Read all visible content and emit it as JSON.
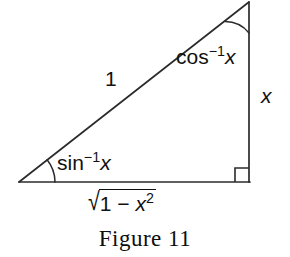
{
  "figure": {
    "caption": "Figure 11",
    "type": "right-triangle-inverse-trig-diagram",
    "stroke_color": "#2b2b2b",
    "text_color": "#111111",
    "background_color": "#ffffff",
    "geometry": {
      "left_vertex": [
        19,
        182
      ],
      "right_angle_vertex": [
        249,
        182
      ],
      "apex_vertex": [
        249,
        2
      ],
      "right_angle_marker_size": 14,
      "sin_arc_radius": 36,
      "cos_arc_radius": 31
    },
    "labels": {
      "hypotenuse": "1",
      "opposite_leg": "x",
      "adjacent_leg_function": "√",
      "adjacent_leg_radicand_lead": "1 − ",
      "adjacent_leg_radicand_var": "x",
      "adjacent_leg_radicand_exp": "2",
      "angle_at_left_fn": "sin",
      "angle_at_left_sup": "−1",
      "angle_at_left_var": "x",
      "angle_at_apex_fn": "cos",
      "angle_at_apex_sup": "−1",
      "angle_at_apex_var": "x"
    }
  }
}
